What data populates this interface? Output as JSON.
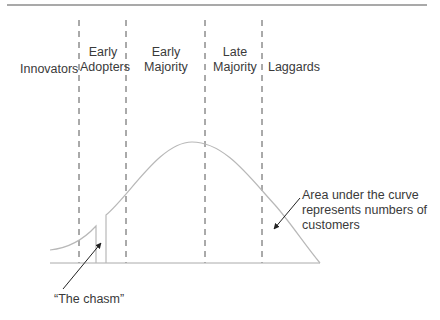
{
  "diagram": {
    "segments": [
      {
        "line1": "",
        "line2": "Innovators"
      },
      {
        "line1": "Early",
        "line2": "Adopters"
      },
      {
        "line1": "Early",
        "line2": "Majority"
      },
      {
        "line1": "Late",
        "line2": "Majority"
      },
      {
        "line1": "",
        "line2": "Laggards"
      }
    ],
    "annotations": {
      "chasm": "“The chasm”",
      "area_line1": "Area under the curve",
      "area_line2": "represents numbers of",
      "area_line3": "customers"
    },
    "colors": {
      "curve": "#b8b8b8",
      "rule": "#555555",
      "dash": "#555555",
      "text": "#3a3a3a"
    }
  }
}
